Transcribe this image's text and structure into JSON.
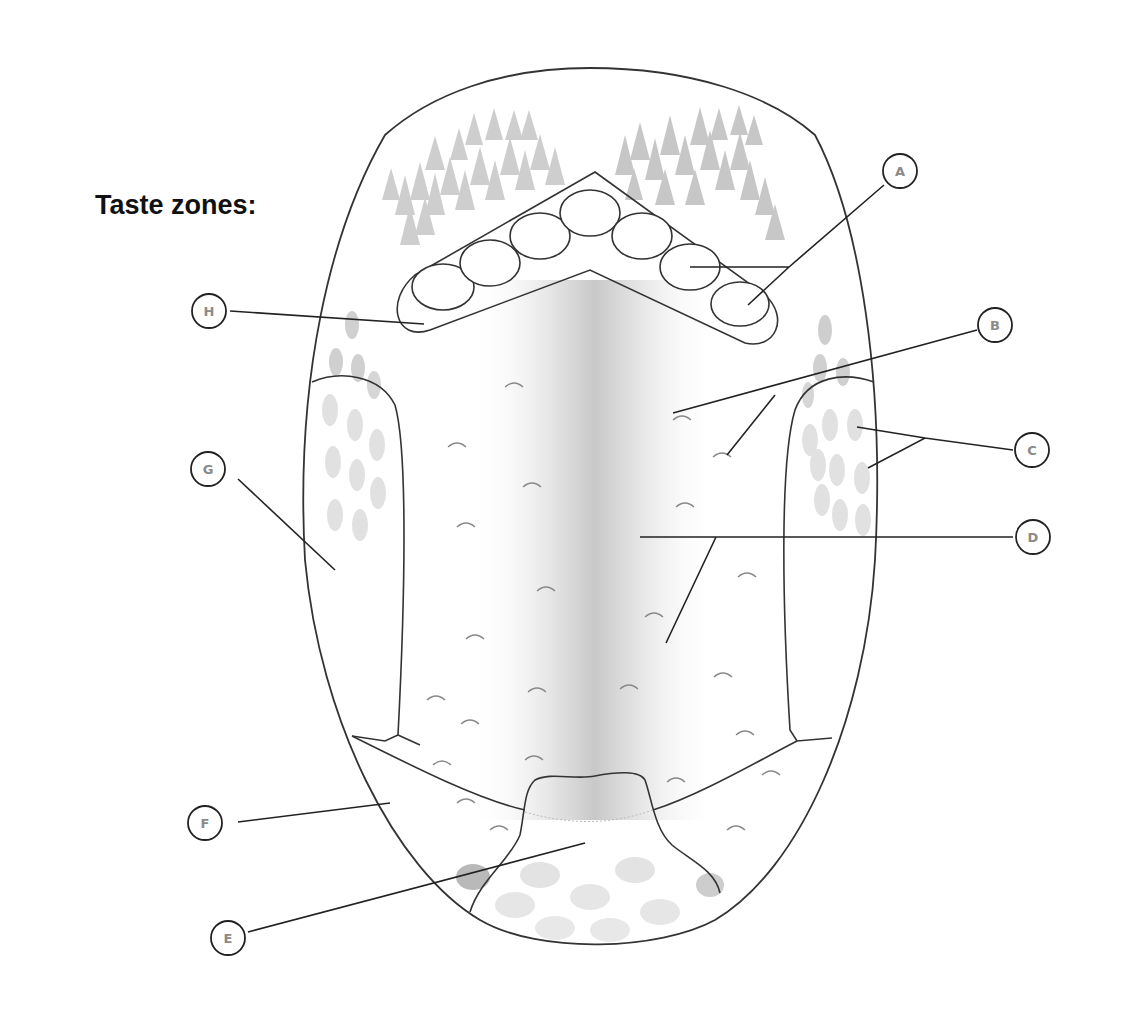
{
  "title": "Taste zones:",
  "labels": [
    {
      "id": "A",
      "text": "A",
      "cx": 900,
      "cy": 171
    },
    {
      "id": "B",
      "text": "B",
      "cx": 995,
      "cy": 325
    },
    {
      "id": "C",
      "text": "C",
      "cx": 1032,
      "cy": 450
    },
    {
      "id": "D",
      "text": "D",
      "cx": 1033,
      "cy": 537
    },
    {
      "id": "E",
      "text": "E",
      "cx": 228,
      "cy": 938
    },
    {
      "id": "F",
      "text": "F",
      "cx": 205,
      "cy": 823
    },
    {
      "id": "G",
      "text": "G",
      "cx": 208,
      "cy": 469
    },
    {
      "id": "H",
      "text": "H",
      "cx": 209,
      "cy": 311
    }
  ],
  "colors": {
    "outline": "#333333",
    "label_text": "#8a8a8a",
    "papillae": "#b8b8b8",
    "midline_shade": "#cfcfcf"
  }
}
